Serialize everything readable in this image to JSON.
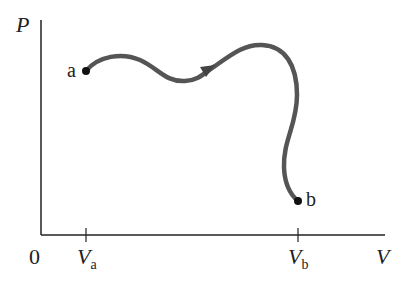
{
  "diagram": {
    "type": "pv-diagram",
    "axes": {
      "y_label": "P",
      "x_label": "V",
      "origin_label": "0"
    },
    "ticks": [
      {
        "label": "V",
        "subscript": "a"
      },
      {
        "label": "V",
        "subscript": "b"
      }
    ],
    "points": [
      {
        "label": "a"
      },
      {
        "label": "b"
      }
    ],
    "colors": {
      "axis": "#222222",
      "curve": "#555555",
      "point": "#111111"
    }
  }
}
